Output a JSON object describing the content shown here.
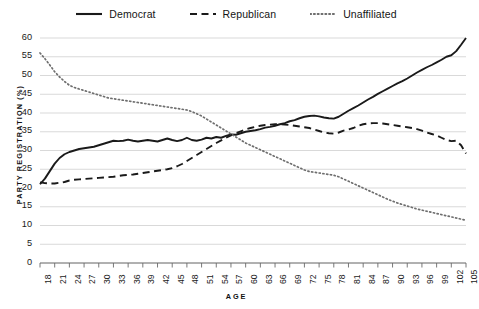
{
  "chart_data": {
    "type": "line",
    "title": "",
    "xlabel": "AGE",
    "ylabel": "PARTY REGISTRATION (%)",
    "xlim": [
      18,
      105
    ],
    "ylim": [
      0,
      60
    ],
    "ytick_step": 5,
    "xtick_step": 3,
    "grid": true,
    "legend_position": "top-center",
    "yticks": [
      0,
      5,
      10,
      15,
      20,
      25,
      30,
      35,
      40,
      45,
      50,
      55,
      60
    ],
    "xticks": [
      18,
      21,
      24,
      27,
      30,
      33,
      36,
      39,
      42,
      45,
      48,
      51,
      54,
      57,
      60,
      63,
      66,
      69,
      72,
      75,
      78,
      81,
      84,
      87,
      90,
      93,
      96,
      99,
      102,
      105
    ],
    "x": [
      18,
      19,
      20,
      21,
      22,
      23,
      24,
      25,
      26,
      27,
      28,
      29,
      30,
      31,
      32,
      33,
      34,
      35,
      36,
      37,
      38,
      39,
      40,
      41,
      42,
      43,
      44,
      45,
      46,
      47,
      48,
      49,
      50,
      51,
      52,
      53,
      54,
      55,
      56,
      57,
      58,
      59,
      60,
      61,
      62,
      63,
      64,
      65,
      66,
      67,
      68,
      69,
      70,
      71,
      72,
      73,
      74,
      75,
      76,
      77,
      78,
      79,
      80,
      81,
      82,
      83,
      84,
      85,
      86,
      87,
      88,
      89,
      90,
      91,
      92,
      93,
      94,
      95,
      96,
      97,
      98,
      99,
      100,
      101,
      102,
      103,
      104,
      105
    ],
    "series": [
      {
        "name": "Democrat",
        "style": "solid",
        "color": "#1a1a1a",
        "values": [
          21.0,
          22.5,
          24.5,
          26.5,
          28.0,
          29.0,
          29.6,
          30.0,
          30.4,
          30.6,
          30.8,
          31.0,
          31.4,
          31.8,
          32.2,
          32.6,
          32.5,
          32.6,
          32.9,
          32.6,
          32.4,
          32.6,
          32.8,
          32.6,
          32.4,
          32.8,
          33.2,
          32.8,
          32.5,
          32.8,
          33.4,
          32.8,
          32.6,
          32.9,
          33.4,
          33.2,
          33.6,
          33.4,
          33.9,
          34.3,
          34.2,
          34.6,
          35.0,
          35.2,
          35.4,
          35.7,
          36.1,
          36.3,
          36.6,
          37.0,
          37.3,
          37.8,
          38.1,
          38.6,
          39.0,
          39.2,
          39.3,
          39.1,
          38.8,
          38.6,
          38.5,
          39.0,
          39.8,
          40.6,
          41.3,
          42.0,
          42.8,
          43.6,
          44.3,
          45.1,
          45.8,
          46.5,
          47.2,
          47.9,
          48.5,
          49.2,
          50.0,
          50.8,
          51.5,
          52.2,
          52.8,
          53.5,
          54.2,
          55.0,
          55.4,
          56.5,
          58.2,
          60.0
        ]
      },
      {
        "name": "Republican",
        "style": "dashed",
        "color": "#1a1a1a",
        "values": [
          21.5,
          21.3,
          21.2,
          21.2,
          21.4,
          21.6,
          22.0,
          22.2,
          22.3,
          22.4,
          22.5,
          22.6,
          22.7,
          22.8,
          22.9,
          23.0,
          23.2,
          23.4,
          23.5,
          23.6,
          23.8,
          24.0,
          24.2,
          24.4,
          24.6,
          24.8,
          25.0,
          25.3,
          25.8,
          26.4,
          27.2,
          28.0,
          28.8,
          29.6,
          30.4,
          31.2,
          32.0,
          32.7,
          33.4,
          34.0,
          34.6,
          35.1,
          35.6,
          36.0,
          36.3,
          36.6,
          36.8,
          36.9,
          37.0,
          37.0,
          36.9,
          36.8,
          36.6,
          36.4,
          36.2,
          36.0,
          35.6,
          35.2,
          34.8,
          34.6,
          34.5,
          34.8,
          35.3,
          35.6,
          36.0,
          36.6,
          37.0,
          37.2,
          37.3,
          37.3,
          37.2,
          37.0,
          36.8,
          36.6,
          36.4,
          36.2,
          36.0,
          35.7,
          35.3,
          34.8,
          34.4,
          34.0,
          33.4,
          32.8,
          32.5,
          32.6,
          31.4,
          29.2
        ]
      },
      {
        "name": "Unaffiliated",
        "style": "dotted",
        "color": "#6e6e6e",
        "values": [
          56.0,
          54.5,
          52.8,
          51.0,
          49.6,
          48.4,
          47.4,
          46.8,
          46.4,
          46.0,
          45.6,
          45.2,
          44.8,
          44.4,
          44.0,
          43.8,
          43.6,
          43.4,
          43.2,
          43.0,
          42.8,
          42.6,
          42.4,
          42.2,
          42.0,
          41.8,
          41.6,
          41.4,
          41.2,
          41.0,
          40.8,
          40.4,
          39.8,
          39.2,
          38.4,
          37.6,
          36.8,
          36.0,
          35.2,
          34.4,
          33.6,
          32.8,
          32.0,
          31.4,
          30.8,
          30.2,
          29.6,
          29.0,
          28.4,
          27.8,
          27.2,
          26.6,
          26.0,
          25.4,
          24.8,
          24.4,
          24.2,
          24.0,
          23.8,
          23.6,
          23.4,
          23.0,
          22.4,
          21.8,
          21.2,
          20.6,
          20.0,
          19.4,
          18.8,
          18.2,
          17.6,
          17.0,
          16.5,
          16.0,
          15.6,
          15.2,
          14.8,
          14.4,
          14.1,
          13.8,
          13.5,
          13.2,
          12.9,
          12.6,
          12.3,
          12.0,
          11.7,
          11.4
        ]
      }
    ]
  },
  "legend": {
    "items": [
      {
        "label": "Democrat",
        "style": "solid"
      },
      {
        "label": "Republican",
        "style": "dashed"
      },
      {
        "label": "Unaffiliated",
        "style": "dotted"
      }
    ]
  },
  "colors": {
    "democrat": "#1a1a1a",
    "republican": "#1a1a1a",
    "unaffiliated": "#6e6e6e",
    "grid": "#c9c9c9",
    "axis": "#6a6a6a",
    "text": "#1a1a1a"
  }
}
